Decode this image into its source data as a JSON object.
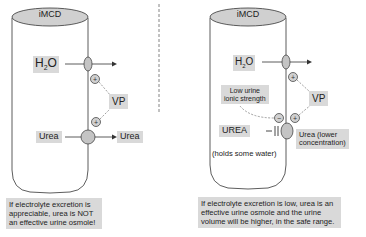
{
  "left_panel": {
    "duct_label": "iMCD",
    "water_label": "H2O",
    "water_main": "H",
    "water_sub": "2",
    "water_end": "O",
    "hormone_label": "VP",
    "urea_in_label": "Urea",
    "urea_out_label": "Urea",
    "caption": "If electrolyte excretion is appreciable, urea is NOT an effective urine osmole!"
  },
  "right_panel": {
    "duct_label": "iMCD",
    "water_main": "H",
    "water_sub": "2",
    "water_end": "O",
    "hormone_label": "VP",
    "ionic_label_line1": "Low urine",
    "ionic_label_line2": "ionic strength",
    "urea_label": "UREA",
    "urea_note": "(holds some water)",
    "urea_out_line1": "Urea (lower",
    "urea_out_line2": "concentration)",
    "caption": "If electrolyte excretion is low, urea is an effective urine osmole and the urine volume will be higher, in the safe range."
  },
  "colors": {
    "label_bg": "#d9d9d9",
    "line": "#333333",
    "dashed": "#777777",
    "channel_fill": "#bbbbbb"
  }
}
